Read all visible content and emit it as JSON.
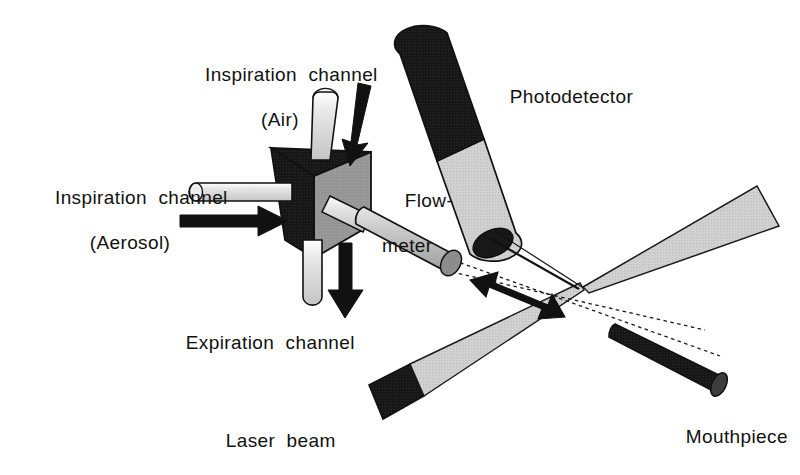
{
  "figure": {
    "background_color": "#ffffff",
    "width": 800,
    "height": 475
  },
  "palette": {
    "ink": "#111111",
    "outline": "#1a1a1a",
    "black_fill": "#141414",
    "dark_fill": "#262626",
    "mid_gray": "#9a9a9a",
    "light_gray": "#d2d2d2",
    "pale_gray": "#e2e2e2",
    "tube_light": "#dcdcdc",
    "paper": "#ffffff"
  },
  "labels": {
    "inspiration_air": {
      "line1": "Inspiration  channel",
      "line2": "(Air)",
      "x": 175,
      "y": 42
    },
    "inspiration_aerosol": {
      "line1": "Inspiration  channel",
      "line2": "(Aerosol)",
      "x": 30,
      "y": 165
    },
    "expiration": {
      "line1": "Expiration  channel",
      "x": 163,
      "y": 310
    },
    "flowmeter": {
      "line1": "Flow-",
      "line2": "meter",
      "x": 382,
      "y": 168
    },
    "photodetector": {
      "line1": "Photodetector",
      "x": 487,
      "y": 64
    },
    "laser_beam": {
      "line1": "Laser  beam",
      "x": 203,
      "y": 408
    },
    "mouthpiece": {
      "line1": "Mouthpiece",
      "x": 663,
      "y": 404
    }
  },
  "components": {
    "valve_block": {
      "name": "three-way valve block",
      "shading": [
        "black top face",
        "black left face",
        "gray right face"
      ]
    },
    "air_tube": {
      "name": "air inspiration tube",
      "orientation": "vertical-top"
    },
    "aerosol_tube": {
      "name": "aerosol inspiration tube",
      "orientation": "horizontal-left"
    },
    "expiration_tube": {
      "name": "expiration tube",
      "orientation": "vertical-bottom"
    },
    "flowmeter_tube": {
      "name": "flowmeter cylinder",
      "orientation": "diagonal-down-right"
    },
    "photodetector": {
      "name": "photodetector cylinder",
      "tip": "dark lens aperture"
    },
    "mouthpiece": {
      "name": "mouthpiece cylinder",
      "fill": "dark"
    },
    "laser_beam_lower": {
      "name": "laser beam lower wedge",
      "source_block": "black"
    },
    "laser_beam_upper": {
      "name": "laser beam upper wedge"
    },
    "measurement_volume": {
      "name": "beam crossing point"
    }
  },
  "arrows": {
    "air_flow": {
      "label": "air inflow",
      "direction": "down-right"
    },
    "aerosol_flow": {
      "label": "aerosol inflow",
      "direction": "right"
    },
    "expiration_flow": {
      "label": "expiration outflow",
      "direction": "down"
    },
    "measurement_axis": {
      "label": "flow measurement axis",
      "direction": "bidirectional"
    }
  }
}
